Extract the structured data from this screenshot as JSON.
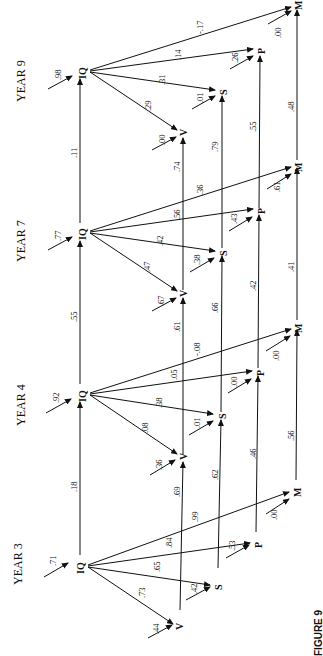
{
  "figure": {
    "caption": "FIGURE 9",
    "orientation": "rotated 90 degrees clockwise",
    "variables": [
      "IQ",
      "V",
      "S",
      "P",
      "M"
    ],
    "years": [
      {
        "label": "YEAR 9",
        "iq_residual": ".98",
        "iq_to": {
          "V": ".29",
          "S": ".31",
          "P": ".14",
          "M": "-.17"
        },
        "residuals": {
          "V": ".00",
          "S": ".01",
          "P": ".26",
          "M": ".00"
        }
      },
      {
        "label": "YEAR 7",
        "iq_residual": ".77",
        "iq_to": {
          "V": ".47",
          "S": ".42",
          "P": ".56",
          "M": ".36"
        },
        "residuals": {
          "V": ".67",
          "S": ".38",
          "P": ".43",
          "M": ".61"
        }
      },
      {
        "label": "YEAR 4",
        "iq_residual": ".92",
        "iq_to": {
          "V": ".08",
          "S": ".38",
          "P": ".05",
          "M": "-.08"
        },
        "residuals": {
          "V": ".36",
          "S": ".01",
          "P": ".00",
          "M": ".00"
        }
      },
      {
        "label": "YEAR 3",
        "iq_residual": ".71",
        "iq_to": {
          "V": ".73",
          "S": ".65",
          "P": ".84",
          "M": ".99"
        },
        "residuals": {
          "V": ".44",
          "S": ".42",
          "P": ".53",
          "M": ".00"
        }
      }
    ],
    "stability_paths": {
      "Y3_to_Y4": {
        "IQ": ".18",
        "V": ".69",
        "S": ".62",
        "P": ".46",
        "M": ".56"
      },
      "Y4_to_Y7": {
        "IQ": ".55",
        "V": ".61",
        "S": ".66",
        "P": ".42",
        "M": ".41"
      },
      "Y7_to_Y9": {
        "IQ": ".11",
        "V": ".74",
        "S": ".79",
        "P": ".55",
        "M": ".48"
      }
    }
  }
}
